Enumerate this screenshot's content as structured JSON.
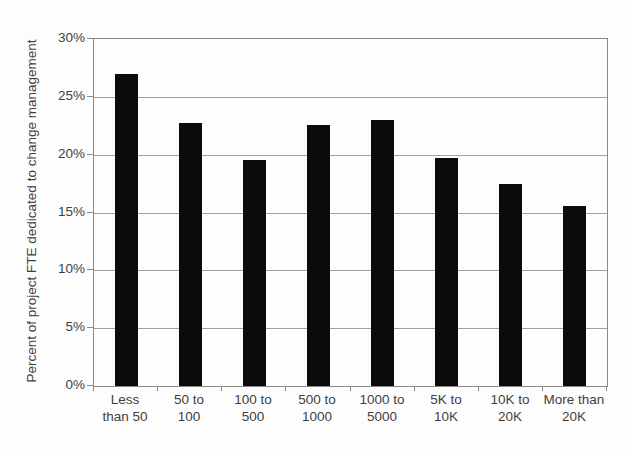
{
  "chart_data": {
    "type": "bar",
    "title": "",
    "ylabel": "Percent of project FTE dedicated to change management",
    "xlabel": "",
    "categories": [
      "Less\nthan 50",
      "50 to\n100",
      "100 to\n500",
      "500 to\n1000",
      "1000 to\n5000",
      "5K to\n10K",
      "10K to\n20K",
      "More than\n20K"
    ],
    "values": [
      27.0,
      22.7,
      19.5,
      22.6,
      23.0,
      19.7,
      17.5,
      15.6
    ],
    "ylim": [
      0,
      30
    ],
    "ytick_step": 5,
    "ytick_labels": [
      "0%",
      "5%",
      "10%",
      "15%",
      "20%",
      "25%",
      "30%"
    ],
    "grid": "horizontal",
    "legend": "none",
    "bar_color": "#0b0b0b",
    "grid_color": "#a2a2a2",
    "axis_color": "#8a8a8a",
    "text_color": "#3f3f3f"
  }
}
